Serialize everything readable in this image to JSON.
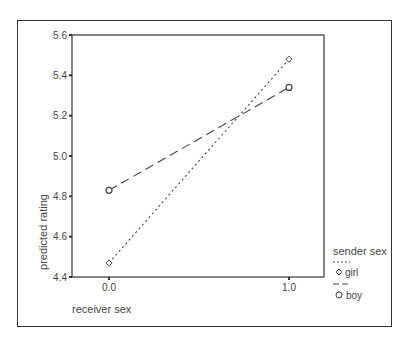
{
  "chart_data": {
    "type": "line",
    "title": "",
    "xlabel": "receiver sex",
    "ylabel": "predicted rating",
    "x": [
      0.0,
      1.0
    ],
    "x_tick_labels": [
      "0.0",
      "1.0"
    ],
    "y_tick_labels": [
      "4.4",
      "4.6",
      "4.8",
      "5.0",
      "5.2",
      "5.4",
      "5.6"
    ],
    "y_ticks": [
      4.4,
      4.6,
      4.8,
      5.0,
      5.2,
      5.4,
      5.6
    ],
    "ylim": [
      4.4,
      5.6
    ],
    "grid": false,
    "legend_title": "sender sex",
    "legend_position": "right",
    "series": [
      {
        "name": "girl",
        "line_style": "dotted",
        "marker": "diamond",
        "values": [
          4.47,
          5.48
        ]
      },
      {
        "name": "boy",
        "line_style": "dashed",
        "marker": "circle",
        "values": [
          4.83,
          5.34
        ]
      }
    ]
  },
  "legend": {
    "title": "sender sex",
    "items": [
      {
        "label": "girl"
      },
      {
        "label": "boy"
      }
    ]
  },
  "axes": {
    "xlabel": "receiver sex",
    "ylabel": "predicted rating"
  },
  "colors": {
    "line": "#444444",
    "frame": "#333333"
  }
}
